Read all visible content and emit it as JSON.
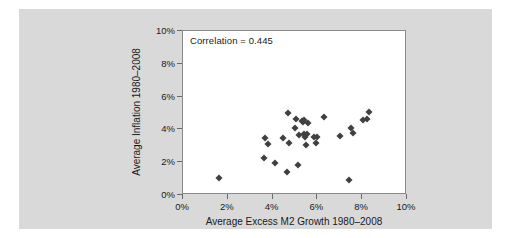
{
  "figure": {
    "background": "#ffffff",
    "panel_color": "#d9d9d9",
    "plot_background": "#ffffff",
    "marker_color": "#404040"
  },
  "annotation": {
    "correlation_text": "Correlation = 0.445"
  },
  "chart_data": {
    "type": "scatter",
    "title": "",
    "subtitle": "",
    "xlabel": "Average Excess M2 Growth 1980–2008",
    "ylabel": "Average Inflation 1980–2008",
    "xlim": [
      0,
      10
    ],
    "ylim": [
      0,
      10
    ],
    "xticks": [
      0,
      2,
      4,
      6,
      8,
      10
    ],
    "yticks": [
      0,
      2,
      4,
      6,
      8,
      10
    ],
    "xtick_labels": [
      "0%",
      "2%",
      "4%",
      "6%",
      "8%",
      "10%"
    ],
    "ytick_labels": [
      "0%",
      "2%",
      "4%",
      "6%",
      "8%",
      "10%"
    ],
    "grid": false,
    "legend": null,
    "annotations": [
      "Correlation = 0.445"
    ],
    "marker": "diamond",
    "n_points": 32,
    "correlation": 0.445,
    "points": [
      [
        1.6,
        1.05
      ],
      [
        3.6,
        2.25
      ],
      [
        3.65,
        3.45
      ],
      [
        3.8,
        3.1
      ],
      [
        4.1,
        1.95
      ],
      [
        4.45,
        3.5
      ],
      [
        4.65,
        1.4
      ],
      [
        4.7,
        5.0
      ],
      [
        4.75,
        3.15
      ],
      [
        5.0,
        4.1
      ],
      [
        5.05,
        4.65
      ],
      [
        5.15,
        1.85
      ],
      [
        5.2,
        3.65
      ],
      [
        5.3,
        4.5
      ],
      [
        5.35,
        4.45
      ],
      [
        5.4,
        3.75
      ],
      [
        5.4,
        4.55
      ],
      [
        5.45,
        3.55
      ],
      [
        5.5,
        3.05
      ],
      [
        5.55,
        3.7
      ],
      [
        5.6,
        4.4
      ],
      [
        5.85,
        3.55
      ],
      [
        5.95,
        3.15
      ],
      [
        6.0,
        3.55
      ],
      [
        6.3,
        4.75
      ],
      [
        7.0,
        3.6
      ],
      [
        7.4,
        0.9
      ],
      [
        7.5,
        4.1
      ],
      [
        7.6,
        3.8
      ],
      [
        8.05,
        4.6
      ],
      [
        8.2,
        4.65
      ],
      [
        8.3,
        5.05
      ]
    ]
  }
}
